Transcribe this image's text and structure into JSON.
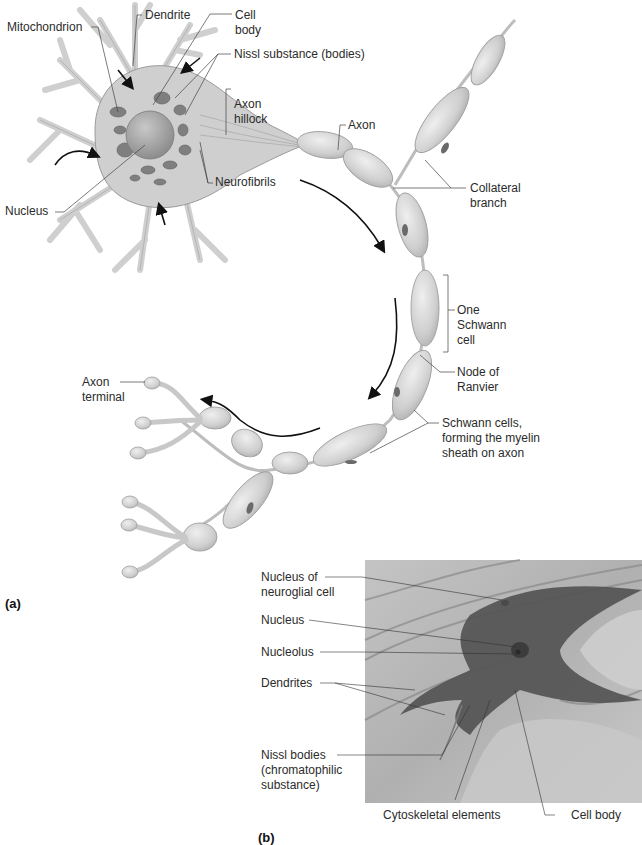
{
  "figure": {
    "panel_a": {
      "label": "(a)",
      "title": "Structure of a neuron (illustration)",
      "labels": {
        "mitochondrion": "Mitochondrion",
        "dendrite": "Dendrite",
        "cell_body": "Cell\nbody",
        "nissl": "Nissl substance (bodies)",
        "axon_hillock": "Axon\nhillock",
        "nucleus": "Nucleus",
        "neurofibrils": "Neurofibrils",
        "axon": "Axon",
        "collateral": "Collateral\nbranch",
        "one_schwann": "One\nSchwann\ncell",
        "node_ranvier": "Node of\nRanvier",
        "schwann_cells": "Schwann cells,\nforming the myelin\nsheath on axon",
        "axon_terminal": "Axon\nterminal"
      }
    },
    "panel_b": {
      "label": "(b)",
      "title": "Micrograph of a neuron",
      "labels": {
        "nucleus_neuroglial": "Nucleus of\nneuroglial cell",
        "nucleus": "Nucleus",
        "nucleolus": "Nucleolus",
        "dendrites": "Dendrites",
        "nissl_bodies": "Nissl bodies\n(chromatophilic\nsubstance)",
        "cytoskeletal": "Cytoskeletal elements",
        "cell_body": "Cell body"
      }
    },
    "colors": {
      "cell_fill": "#d4d4d4",
      "cell_stroke": "#9a9a9a",
      "organelle": "#7a7a7a",
      "micrograph_bg": "#b9b9b9",
      "micrograph_cell": "#4e4e4e",
      "leader_line": "#444444"
    }
  }
}
